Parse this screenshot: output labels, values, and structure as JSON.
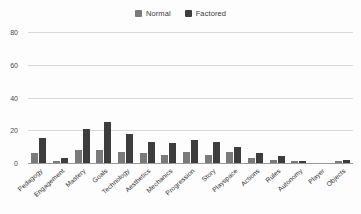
{
  "chart_data": {
    "type": "bar",
    "title": "",
    "subtitle": "",
    "xlabel": "",
    "ylabel": "",
    "ylim": [
      0,
      80
    ],
    "yticks": [
      0,
      20,
      40,
      60,
      80
    ],
    "grid": true,
    "legend_position": "top-center",
    "categories": [
      "Pedagogy",
      "Engagement",
      "Mastery",
      "Goals",
      "Technology",
      "Aesthetics",
      "Mechanics",
      "Progression",
      "Story",
      "Playspace",
      "Actions",
      "Rules",
      "Autonomy",
      "Player",
      "Objects"
    ],
    "series": [
      {
        "name": "Normal",
        "color": "#7a7a7a",
        "values": [
          6,
          1,
          8,
          8,
          7,
          6,
          5,
          7,
          5,
          7,
          3,
          2,
          1,
          0,
          1
        ]
      },
      {
        "name": "Factored",
        "color": "#3d3d3d",
        "values": [
          15,
          3,
          21,
          25,
          18,
          13,
          12,
          14,
          13,
          10,
          6,
          4,
          1,
          0,
          2
        ]
      }
    ]
  },
  "legend": {
    "items": [
      {
        "label": "Normal",
        "color": "#7a7a7a"
      },
      {
        "label": "Factored",
        "color": "#3d3d3d"
      }
    ]
  },
  "axes": {
    "y": {
      "ticks": [
        "80",
        "60",
        "40",
        "20",
        "0"
      ]
    }
  },
  "colors": {
    "grid": "#d9d9d9",
    "axis": "#9a9a9a",
    "text": "#3a3a3a",
    "background": "#fdfdfd"
  }
}
